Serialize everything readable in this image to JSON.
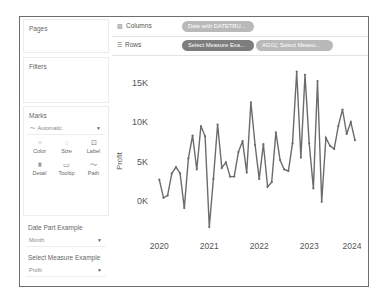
{
  "left_panel": {
    "pages_title": "Pages",
    "filters_title": "Filters",
    "marks": {
      "title": "Marks",
      "mark_type": "Automatic",
      "buttons": [
        {
          "label": "Color",
          "icon": "color-icon"
        },
        {
          "label": "Size",
          "icon": "size-icon"
        },
        {
          "label": "Label",
          "icon": "label-icon"
        },
        {
          "label": "Detail",
          "icon": "detail-icon"
        },
        {
          "label": "Tooltip",
          "icon": "tooltip-icon"
        },
        {
          "label": "Path",
          "icon": "path-icon"
        }
      ]
    },
    "date_part_param": {
      "title": "Date Part Example",
      "value": "Month"
    },
    "select_measure_param": {
      "title": "Select Measure Example",
      "value": "Profit"
    }
  },
  "shelves": {
    "columns": {
      "label": "Columns",
      "pills": [
        "Date with DATETRU..."
      ]
    },
    "rows": {
      "label": "Rows",
      "pills": [
        "Select Measure Exa...",
        "AGG(: Select Measu..."
      ]
    }
  },
  "colors": {
    "line": "#6b6b6b",
    "pill_dark": "#7d7d7d",
    "pill_light": "#b9b9b9"
  },
  "chart_data": {
    "type": "line",
    "title": "",
    "xlabel": "",
    "ylabel": "Profit",
    "x_tick_labels": [
      "2020",
      "2021",
      "2022",
      "2023",
      "2024"
    ],
    "y_tick_labels": [
      "0K",
      "5K",
      "10K",
      "15K"
    ],
    "y_ticks": [
      0,
      5000,
      10000,
      15000
    ],
    "ylim": [
      -4000,
      17500
    ],
    "grid": false,
    "x_start": "2020-01",
    "x_granularity": "month",
    "series": [
      {
        "name": "Profit",
        "values": [
          2700,
          400,
          700,
          3500,
          4300,
          3500,
          -900,
          5400,
          8300,
          4000,
          9500,
          8200,
          -3300,
          2800,
          9700,
          4200,
          4900,
          3100,
          3100,
          6200,
          7600,
          3600,
          12500,
          7100,
          2800,
          7200,
          1800,
          2400,
          8700,
          5200,
          4000,
          3800,
          7300,
          16400,
          5500,
          16000,
          7300,
          1600,
          15200,
          -100,
          8000,
          7000,
          6600,
          9500,
          11600,
          8500,
          10000,
          7700
        ]
      }
    ]
  }
}
